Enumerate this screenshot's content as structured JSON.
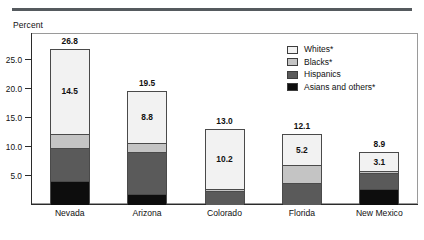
{
  "figure": {
    "axis_title": "Percent"
  },
  "legend": {
    "items": [
      {
        "label": "Whites*",
        "color": "#f2f2f2"
      },
      {
        "label": "Blacks*",
        "color": "#c4c4c4"
      },
      {
        "label": "Hispanics",
        "color": "#5a5a5a"
      },
      {
        "label": "Asians and others*",
        "color": "#0d0d0d"
      }
    ]
  },
  "chart_data": {
    "type": "bar",
    "title": "",
    "subtitle": "",
    "xlabel": "",
    "ylabel": "Percent",
    "stacked": true,
    "grid": false,
    "legend_position": "top-right",
    "ylim": [
      0,
      29.5
    ],
    "yticks": [
      5.0,
      10.0,
      15.0,
      20.0,
      25.0
    ],
    "ytick_labels": [
      "5.0",
      "10.0",
      "15.0",
      "20.0",
      "25.0"
    ],
    "categories": [
      "Nevada",
      "Arizona",
      "Colorado",
      "Florida",
      "New Mexico"
    ],
    "series": [
      {
        "name": "Asians and others*",
        "values": [
          4.2,
          1.9,
          0.0,
          0.0,
          2.7
        ],
        "color": "#0d0d0d"
      },
      {
        "name": "Hispanics",
        "values": [
          5.6,
          7.3,
          2.5,
          3.8,
          2.8
        ],
        "color": "#5a5a5a"
      },
      {
        "name": "Blacks*",
        "values": [
          2.5,
          1.5,
          0.3,
          3.1,
          0.3
        ],
        "color": "#c4c4c4"
      },
      {
        "name": "Whites*",
        "values": [
          14.5,
          8.8,
          10.2,
          5.2,
          3.1
        ],
        "color": "#f2f2f2"
      }
    ],
    "totals": [
      26.8,
      19.5,
      13.0,
      12.1,
      8.9
    ],
    "total_labels": [
      "26.8",
      "19.5",
      "13.0",
      "12.1",
      "8.9"
    ],
    "whites_labels": [
      "14.5",
      "8.8",
      "10.2",
      "5.2",
      "3.1"
    ]
  }
}
